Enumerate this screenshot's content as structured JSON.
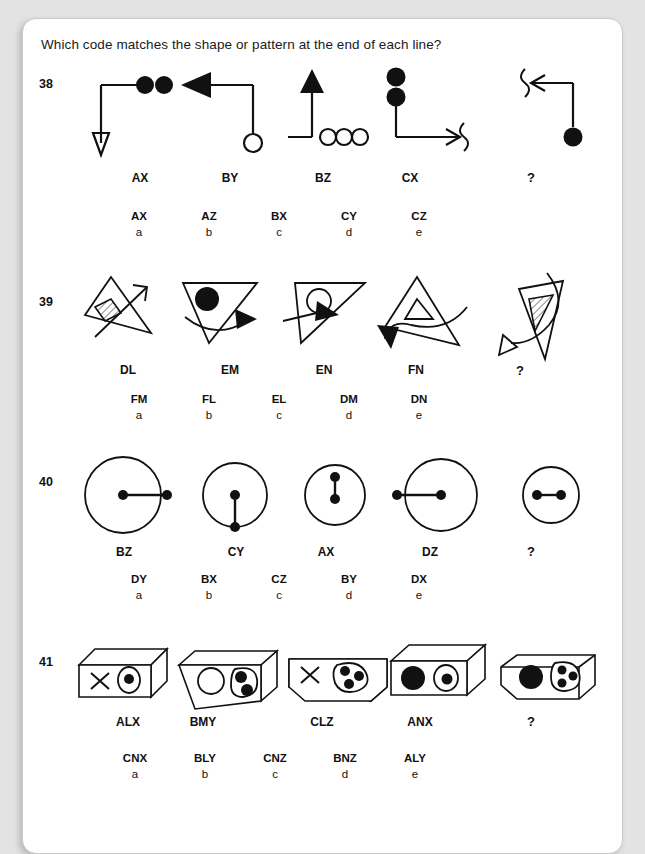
{
  "page": {
    "prompt": "Which code matches the shape or pattern at the end of each line?"
  },
  "questions": [
    {
      "number": "38",
      "figures": [
        {
          "code": "AX",
          "shape": "line-down-arrow-two-filled-circles"
        },
        {
          "code": "BY",
          "shape": "line-left-solid-arrow-open-circle"
        },
        {
          "code": "BZ",
          "shape": "line-up-solid-triangle-three-open-circles"
        },
        {
          "code": "CX",
          "shape": "line-right-wavy-arrow-two-filled-circles"
        },
        {
          "code": "?",
          "shape": "line-left-wavy-arrow-one-filled-circle"
        }
      ],
      "options": [
        {
          "code": "AX",
          "letter": "a"
        },
        {
          "code": "AZ",
          "letter": "b"
        },
        {
          "code": "BX",
          "letter": "c"
        },
        {
          "code": "CY",
          "letter": "d"
        },
        {
          "code": "CZ",
          "letter": "e"
        }
      ]
    },
    {
      "number": "39",
      "figures": [
        {
          "code": "DL",
          "shape": "triangle-hatched-square-plain-arrow"
        },
        {
          "code": "EM",
          "shape": "triangle-filled-circle-curved-arrow"
        },
        {
          "code": "EN",
          "shape": "triangle-open-circle-straight-arrow"
        },
        {
          "code": "FN",
          "shape": "triangle-open-triangle-curved-down-arrow"
        },
        {
          "code": "?",
          "shape": "triangle-hatched-triangle-curved-arrow"
        }
      ],
      "options": [
        {
          "code": "FM",
          "letter": "a"
        },
        {
          "code": "FL",
          "letter": "b"
        },
        {
          "code": "EL",
          "letter": "c"
        },
        {
          "code": "DM",
          "letter": "d"
        },
        {
          "code": "DN",
          "letter": "e"
        }
      ]
    },
    {
      "number": "40",
      "figures": [
        {
          "code": "BZ",
          "shape": "large-circle-dumbbell-crossing-right"
        },
        {
          "code": "CY",
          "shape": "medium-circle-dumbbell-vertical-down"
        },
        {
          "code": "AX",
          "shape": "small-circle-dumbbell-vertical-inside"
        },
        {
          "code": "DZ",
          "shape": "large-circle-dumbbell-crossing-left"
        },
        {
          "code": "?",
          "shape": "small-circle-dumbbell-horizontal-inside"
        }
      ],
      "options": [
        {
          "code": "DY",
          "letter": "a"
        },
        {
          "code": "BX",
          "letter": "b"
        },
        {
          "code": "CZ",
          "letter": "c"
        },
        {
          "code": "BY",
          "letter": "d"
        },
        {
          "code": "DX",
          "letter": "e"
        }
      ]
    },
    {
      "number": "41",
      "figures": [
        {
          "code": "ALX",
          "shape": "box-cross-and-blob-one-dot"
        },
        {
          "code": "BMY",
          "shape": "box-open-circle-and-blob-two-dots"
        },
        {
          "code": "CLZ",
          "shape": "box-cross-and-blob-three-dots"
        },
        {
          "code": "ANX",
          "shape": "box-filled-circle-and-blob-one-dot"
        },
        {
          "code": "?",
          "shape": "box-filled-circle-and-blob-three-dots"
        }
      ],
      "options": [
        {
          "code": "CNX",
          "letter": "a"
        },
        {
          "code": "BLY",
          "letter": "b"
        },
        {
          "code": "CNZ",
          "letter": "c"
        },
        {
          "code": "BNZ",
          "letter": "d"
        },
        {
          "code": "ALY",
          "letter": "e"
        }
      ]
    }
  ]
}
